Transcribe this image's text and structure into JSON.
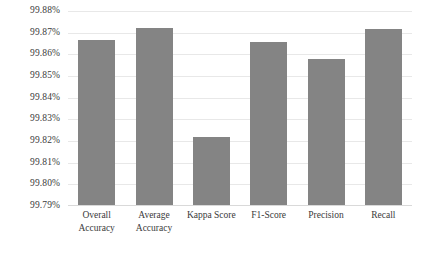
{
  "chart_data": {
    "type": "bar",
    "title": "",
    "subtitle": "",
    "xlabel": "",
    "ylabel": "",
    "categories": [
      "Overall Accuracy",
      "Average Accuracy",
      "Kappa Score",
      "F1-Score",
      "Precision",
      "Recall"
    ],
    "values": [
      99.8666,
      99.8721,
      99.8218,
      99.8657,
      99.8579,
      99.8716
    ],
    "value_labels": [
      "99.8666%",
      "99.8721%",
      "99.8218%",
      "99.8657%",
      "99.8579%",
      "99.8716%"
    ],
    "ylim": [
      99.79,
      99.88
    ],
    "ytick_values": [
      99.88,
      99.87,
      99.86,
      99.85,
      99.84,
      99.83,
      99.82,
      99.81,
      99.8,
      99.79
    ],
    "ytick_labels": [
      "99.88%",
      "99.87%",
      "99.86%",
      "99.85%",
      "99.84%",
      "99.83%",
      "99.82%",
      "99.81%",
      "99.80%",
      "99.79%"
    ],
    "grid": true,
    "grid_axis": "y",
    "legend": false,
    "legend_position": "none",
    "series": [
      {
        "name": "",
        "color": "#848484",
        "values": [
          99.8666,
          99.8721,
          99.8218,
          99.8657,
          99.8579,
          99.8716
        ]
      }
    ],
    "annotations": []
  },
  "style": {
    "bar_color": "#848484",
    "gridline_color": "#e8e8e8",
    "axis_color": "#d9d9d9",
    "text_color": "#3a3a3a",
    "background": "#ffffff"
  }
}
